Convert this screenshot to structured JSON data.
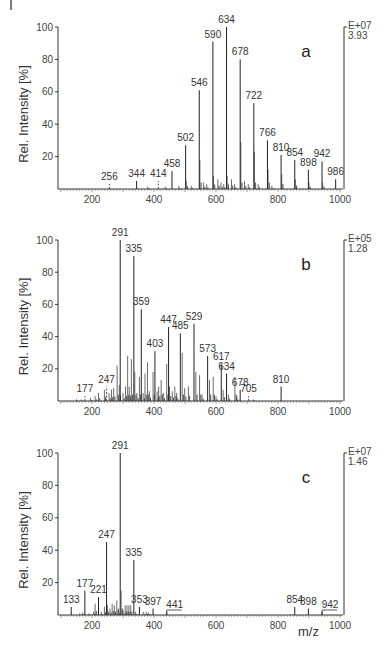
{
  "figure": {
    "ylabel": "Rel. Intensity  [%]",
    "xlabel": "m/z",
    "x_ticks": [
      200,
      400,
      600,
      800,
      1000
    ],
    "y_ticks": [
      20,
      40,
      60,
      80,
      100
    ]
  },
  "chart_data": [
    {
      "type": "bar",
      "panel": "a",
      "title": "a",
      "xlabel": "m/z",
      "ylabel": "Rel. Intensity [%]",
      "xlim": [
        90,
        1010
      ],
      "ylim": [
        0,
        100
      ],
      "scale_exponent": "E+07",
      "scale_value": "3.93",
      "labeled_peaks": [
        {
          "mz": 256,
          "intensity": 3,
          "label": "256",
          "dashed": true
        },
        {
          "mz": 344,
          "intensity": 5,
          "label": "344"
        },
        {
          "mz": 414,
          "intensity": 5,
          "label": "414",
          "dashed": true
        },
        {
          "mz": 458,
          "intensity": 11,
          "label": "458"
        },
        {
          "mz": 502,
          "intensity": 27,
          "label": "502"
        },
        {
          "mz": 546,
          "intensity": 61,
          "label": "546"
        },
        {
          "mz": 590,
          "intensity": 91,
          "label": "590"
        },
        {
          "mz": 634,
          "intensity": 100,
          "label": "634"
        },
        {
          "mz": 678,
          "intensity": 80,
          "label": "678"
        },
        {
          "mz": 722,
          "intensity": 53,
          "label": "722"
        },
        {
          "mz": 766,
          "intensity": 30,
          "label": "766"
        },
        {
          "mz": 810,
          "intensity": 21,
          "label": "810"
        },
        {
          "mz": 854,
          "intensity": 18,
          "label": "854"
        },
        {
          "mz": 898,
          "intensity": 12,
          "label": "898"
        },
        {
          "mz": 942,
          "intensity": 17,
          "label": "942"
        },
        {
          "mz": 986,
          "intensity": 6,
          "label": "986"
        }
      ],
      "minor_peaks": [
        {
          "mz": 380,
          "intensity": 1.5
        },
        {
          "mz": 436,
          "intensity": 1.5
        },
        {
          "mz": 480,
          "intensity": 2
        },
        {
          "mz": 504,
          "intensity": 5
        },
        {
          "mz": 520,
          "intensity": 2
        },
        {
          "mz": 548,
          "intensity": 18
        },
        {
          "mz": 560,
          "intensity": 4
        },
        {
          "mz": 570,
          "intensity": 3
        },
        {
          "mz": 592,
          "intensity": 8
        },
        {
          "mz": 606,
          "intensity": 6
        },
        {
          "mz": 616,
          "intensity": 4
        },
        {
          "mz": 625,
          "intensity": 3
        },
        {
          "mz": 636,
          "intensity": 8
        },
        {
          "mz": 650,
          "intensity": 6
        },
        {
          "mz": 660,
          "intensity": 3
        },
        {
          "mz": 680,
          "intensity": 29
        },
        {
          "mz": 692,
          "intensity": 5
        },
        {
          "mz": 704,
          "intensity": 3
        },
        {
          "mz": 724,
          "intensity": 23
        },
        {
          "mz": 736,
          "intensity": 3
        },
        {
          "mz": 768,
          "intensity": 12
        },
        {
          "mz": 780,
          "intensity": 2
        },
        {
          "mz": 812,
          "intensity": 9
        },
        {
          "mz": 856,
          "intensity": 6
        },
        {
          "mz": 900,
          "intensity": 4
        },
        {
          "mz": 944,
          "intensity": 4
        }
      ]
    },
    {
      "type": "bar",
      "panel": "b",
      "title": "b",
      "xlabel": "m/z",
      "ylabel": "Rel. Intensity [%]",
      "xlim": [
        90,
        1010
      ],
      "ylim": [
        0,
        100
      ],
      "scale_exponent": "E+05",
      "scale_value": "1.28",
      "labeled_peaks": [
        {
          "mz": 177,
          "intensity": 3,
          "label": "177",
          "dashed": true
        },
        {
          "mz": 247,
          "intensity": 9,
          "label": "247",
          "dashed": true
        },
        {
          "mz": 291,
          "intensity": 100,
          "label": "291"
        },
        {
          "mz": 335,
          "intensity": 90,
          "label": "335"
        },
        {
          "mz": 359,
          "intensity": 57,
          "label": "359"
        },
        {
          "mz": 403,
          "intensity": 31,
          "label": "403"
        },
        {
          "mz": 447,
          "intensity": 46,
          "label": "447"
        },
        {
          "mz": 485,
          "intensity": 42,
          "label": "485"
        },
        {
          "mz": 529,
          "intensity": 48,
          "label": "529"
        },
        {
          "mz": 573,
          "intensity": 28,
          "label": "573"
        },
        {
          "mz": 617,
          "intensity": 23,
          "label": "617"
        },
        {
          "mz": 634,
          "intensity": 17,
          "label": "634"
        },
        {
          "mz": 678,
          "intensity": 7,
          "label": "678"
        },
        {
          "mz": 705,
          "intensity": 3,
          "label": "705",
          "dashed": true
        },
        {
          "mz": 810,
          "intensity": 9,
          "label": "810"
        }
      ],
      "minor_peaks": [
        {
          "mz": 150,
          "intensity": 1
        },
        {
          "mz": 165,
          "intensity": 1
        },
        {
          "mz": 195,
          "intensity": 2
        },
        {
          "mz": 210,
          "intensity": 3
        },
        {
          "mz": 221,
          "intensity": 5
        },
        {
          "mz": 240,
          "intensity": 7
        },
        {
          "mz": 255,
          "intensity": 5
        },
        {
          "mz": 263,
          "intensity": 7
        },
        {
          "mz": 270,
          "intensity": 8
        },
        {
          "mz": 281,
          "intensity": 22
        },
        {
          "mz": 288,
          "intensity": 10
        },
        {
          "mz": 300,
          "intensity": 5
        },
        {
          "mz": 308,
          "intensity": 9
        },
        {
          "mz": 315,
          "intensity": 28
        },
        {
          "mz": 320,
          "intensity": 9
        },
        {
          "mz": 327,
          "intensity": 26
        },
        {
          "mz": 338,
          "intensity": 18
        },
        {
          "mz": 345,
          "intensity": 5
        },
        {
          "mz": 353,
          "intensity": 15
        },
        {
          "mz": 365,
          "intensity": 5
        },
        {
          "mz": 371,
          "intensity": 17
        },
        {
          "mz": 379,
          "intensity": 24
        },
        {
          "mz": 385,
          "intensity": 6
        },
        {
          "mz": 397,
          "intensity": 18
        },
        {
          "mz": 410,
          "intensity": 6
        },
        {
          "mz": 415,
          "intensity": 9
        },
        {
          "mz": 423,
          "intensity": 13
        },
        {
          "mz": 430,
          "intensity": 5
        },
        {
          "mz": 441,
          "intensity": 23
        },
        {
          "mz": 450,
          "intensity": 9
        },
        {
          "mz": 459,
          "intensity": 6
        },
        {
          "mz": 467,
          "intensity": 9
        },
        {
          "mz": 473,
          "intensity": 5
        },
        {
          "mz": 491,
          "intensity": 30
        },
        {
          "mz": 499,
          "intensity": 8
        },
        {
          "mz": 511,
          "intensity": 9
        },
        {
          "mz": 535,
          "intensity": 18
        },
        {
          "mz": 547,
          "intensity": 16
        },
        {
          "mz": 555,
          "intensity": 4
        },
        {
          "mz": 579,
          "intensity": 13
        },
        {
          "mz": 591,
          "intensity": 15
        },
        {
          "mz": 600,
          "intensity": 3
        },
        {
          "mz": 623,
          "intensity": 7
        },
        {
          "mz": 640,
          "intensity": 4
        },
        {
          "mz": 661,
          "intensity": 15
        },
        {
          "mz": 667,
          "intensity": 3
        },
        {
          "mz": 720,
          "intensity": 1
        }
      ]
    },
    {
      "type": "bar",
      "panel": "c",
      "title": "c",
      "xlabel": "m/z",
      "ylabel": "Rel. Intensity [%]",
      "xlim": [
        90,
        1010
      ],
      "ylim": [
        0,
        100
      ],
      "scale_exponent": "E+07",
      "scale_value": "1.46",
      "labeled_peaks": [
        {
          "mz": 133,
          "intensity": 5,
          "label": "133"
        },
        {
          "mz": 177,
          "intensity": 15,
          "label": "177"
        },
        {
          "mz": 221,
          "intensity": 11,
          "label": "221"
        },
        {
          "mz": 247,
          "intensity": 45,
          "label": "247"
        },
        {
          "mz": 291,
          "intensity": 100,
          "label": "291"
        },
        {
          "mz": 335,
          "intensity": 34,
          "label": "335"
        },
        {
          "mz": 353,
          "intensity": 5,
          "label": "353"
        },
        {
          "mz": 397,
          "intensity": 4,
          "label": "397"
        },
        {
          "mz": 441,
          "intensity": 2,
          "label": "441",
          "bracket": true
        },
        {
          "mz": 854,
          "intensity": 5,
          "label": "854"
        },
        {
          "mz": 898,
          "intensity": 4,
          "label": "898"
        },
        {
          "mz": 942,
          "intensity": 2,
          "label": "942",
          "bracket": true
        }
      ],
      "minor_peaks": [
        {
          "mz": 160,
          "intensity": 1
        },
        {
          "mz": 170,
          "intensity": 1.5
        },
        {
          "mz": 190,
          "intensity": 1
        },
        {
          "mz": 205,
          "intensity": 2
        },
        {
          "mz": 210,
          "intensity": 7
        },
        {
          "mz": 230,
          "intensity": 2
        },
        {
          "mz": 240,
          "intensity": 5
        },
        {
          "mz": 250,
          "intensity": 6
        },
        {
          "mz": 258,
          "intensity": 4
        },
        {
          "mz": 265,
          "intensity": 7
        },
        {
          "mz": 272,
          "intensity": 6
        },
        {
          "mz": 280,
          "intensity": 9
        },
        {
          "mz": 286,
          "intensity": 4
        },
        {
          "mz": 294,
          "intensity": 15
        },
        {
          "mz": 300,
          "intensity": 3
        },
        {
          "mz": 307,
          "intensity": 6
        },
        {
          "mz": 313,
          "intensity": 6
        },
        {
          "mz": 319,
          "intensity": 6
        },
        {
          "mz": 325,
          "intensity": 6
        },
        {
          "mz": 340,
          "intensity": 2
        },
        {
          "mz": 365,
          "intensity": 2
        },
        {
          "mz": 375,
          "intensity": 2
        },
        {
          "mz": 383,
          "intensity": 1.5
        }
      ]
    }
  ]
}
